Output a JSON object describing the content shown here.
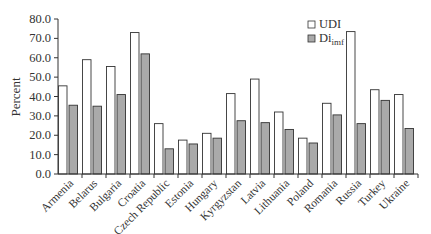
{
  "chart_data": {
    "type": "bar",
    "title": "",
    "xlabel": "",
    "ylabel": "Percent",
    "ylim": [
      0,
      80
    ],
    "yticks": [
      "0.0",
      "10.0",
      "20.0",
      "30.0",
      "40.0",
      "50.0",
      "60.0",
      "70.0",
      "80.0"
    ],
    "grid": false,
    "legend_position": "upper-right-inside",
    "categories": [
      "Armenia",
      "Belarus",
      "Bulgaria",
      "Croatia",
      "Czech Republic",
      "Estonia",
      "Hungary",
      "Kyrgyzstan",
      "Latvia",
      "Lithuania",
      "Poland",
      "Romania",
      "Russia",
      "Turkey",
      "Ukraine"
    ],
    "series": [
      {
        "name": "UDI",
        "color": "#ffffff",
        "values": [
          45.5,
          59.0,
          55.5,
          73.0,
          26.0,
          17.5,
          21.0,
          41.5,
          49.0,
          32.0,
          18.5,
          36.5,
          73.5,
          43.5,
          41.0
        ]
      },
      {
        "name": "Di_imf",
        "label_main": "Di",
        "label_sub": "imf",
        "color": "#aaaaaa",
        "values": [
          35.5,
          35.0,
          41.0,
          62.0,
          13.0,
          15.5,
          18.5,
          27.5,
          26.5,
          23.0,
          16.0,
          30.5,
          26.0,
          38.0,
          23.5
        ]
      }
    ]
  }
}
